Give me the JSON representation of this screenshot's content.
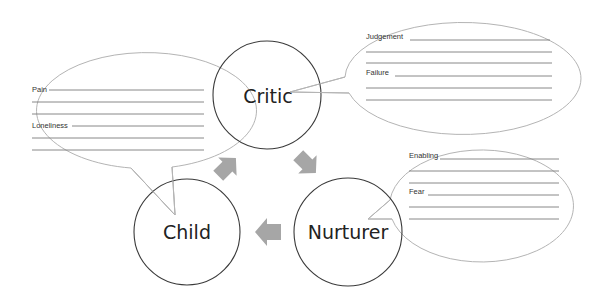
{
  "diagram": {
    "type": "cycle-with-callouts",
    "nodes": [
      {
        "id": "critic",
        "label": "Critic"
      },
      {
        "id": "nurturer",
        "label": "Nurturer"
      },
      {
        "id": "child",
        "label": "Child"
      }
    ],
    "edges": [
      {
        "from": "child",
        "to": "critic"
      },
      {
        "from": "critic",
        "to": "nurturer"
      },
      {
        "from": "nurturer",
        "to": "child"
      }
    ],
    "callouts": {
      "child": {
        "fields": [
          {
            "label": "Pain",
            "blank_lines": 3
          },
          {
            "label": "Loneliness",
            "blank_lines": 3
          }
        ]
      },
      "critic": {
        "fields": [
          {
            "label": "Judgement",
            "blank_lines": 3
          },
          {
            "label": "Failure",
            "blank_lines": 3
          }
        ]
      },
      "nurturer": {
        "fields": [
          {
            "label": "Enabling",
            "blank_lines": 3
          },
          {
            "label": "Fear",
            "blank_lines": 3
          }
        ]
      }
    }
  },
  "colors": {
    "circle_stroke": "#3a3a3a",
    "bubble_stroke": "#b4b4b4",
    "arrow_fill": "#a6a6a6",
    "line": "#7a7a7a"
  }
}
